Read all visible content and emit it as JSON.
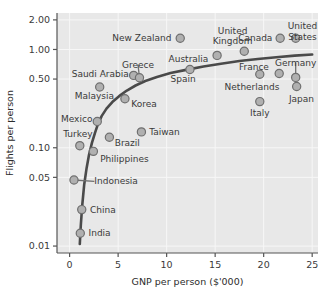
{
  "chart_data": {
    "type": "scatter",
    "title": "",
    "xlabel": "GNP per person ($'000)",
    "ylabel": "Flights per person",
    "xlim": [
      -1.3,
      25.6
    ],
    "ylim": [
      0.0085,
      2.35
    ],
    "yscale": "log",
    "xscale": "linear",
    "xticks": [
      "0",
      "5",
      "10",
      "15",
      "20",
      "25"
    ],
    "xtick_values": [
      0,
      5,
      10,
      15,
      20,
      25
    ],
    "yticks": [
      "2.00",
      "1.00",
      "0.50",
      "0.10",
      "0.05",
      "0.01"
    ],
    "ytick_values": [
      2.0,
      1.0,
      0.5,
      0.1,
      0.05,
      0.01
    ],
    "grid": true,
    "legend": "none",
    "plot_bgcolor": "#e8e8e8",
    "marker_fill": "#b0b0b0",
    "marker_edge": "#6f6f6f",
    "curve_color": "#4a4a4a",
    "gridline_color": "#f7f7f7",
    "axis_color": "#555555",
    "points": [
      {
        "name": "India",
        "x": 1.1,
        "y": 0.0135,
        "lx": 1.95,
        "ly": 0.0135,
        "anchor": "start",
        "leader": false
      },
      {
        "name": "China",
        "x": 1.25,
        "y": 0.0235,
        "lx": 2.1,
        "ly": 0.0235,
        "anchor": "start",
        "leader": false
      },
      {
        "name": "Indonesia",
        "x": 0.45,
        "y": 0.047,
        "lx": 2.55,
        "ly": 0.0455,
        "anchor": "start",
        "leader": true
      },
      {
        "name": "Philippines",
        "x": 2.45,
        "y": 0.092,
        "lx": 3.15,
        "ly": 0.077,
        "anchor": "start",
        "leader": false
      },
      {
        "name": "Turkey",
        "x": 1.05,
        "y": 0.105,
        "lx": 0.85,
        "ly": 0.138,
        "anchor": "middle",
        "leader": false
      },
      {
        "name": "Brazil",
        "x": 4.1,
        "y": 0.128,
        "lx": 4.65,
        "ly": 0.112,
        "anchor": "start",
        "leader": false
      },
      {
        "name": "Taiwan",
        "x": 7.4,
        "y": 0.145,
        "lx": 8.2,
        "ly": 0.146,
        "anchor": "start",
        "leader": false
      },
      {
        "name": "Mexico",
        "x": 2.85,
        "y": 0.185,
        "lx": 2.35,
        "ly": 0.197,
        "anchor": "end",
        "leader": false
      },
      {
        "name": "Korea",
        "x": 5.7,
        "y": 0.315,
        "lx": 6.35,
        "ly": 0.282,
        "anchor": "start",
        "leader": false
      },
      {
        "name": "Malaysia",
        "x": 3.1,
        "y": 0.415,
        "lx": 2.55,
        "ly": 0.335,
        "anchor": "middle",
        "leader": false
      },
      {
        "name": "Saudi Arabia",
        "x": 6.6,
        "y": 0.545,
        "lx": 6.1,
        "ly": 0.56,
        "anchor": "end",
        "leader": false
      },
      {
        "name": "Greece",
        "x": 7.2,
        "y": 0.515,
        "lx": 7.05,
        "ly": 0.7,
        "anchor": "middle",
        "leader": true
      },
      {
        "name": "Spain",
        "x": 12.4,
        "y": 0.625,
        "lx": 11.7,
        "ly": 0.5,
        "anchor": "middle",
        "leader": false
      },
      {
        "name": "Australia",
        "x": 15.2,
        "y": 0.87,
        "lx": 14.3,
        "ly": 0.8,
        "anchor": "end",
        "leader": false
      },
      {
        "name": "New Zealand",
        "x": 11.4,
        "y": 1.3,
        "lx": 10.5,
        "ly": 1.3,
        "anchor": "end",
        "leader": false
      },
      {
        "name": "United Kingdom",
        "x": 18.0,
        "y": 0.96,
        "lx": 16.8,
        "ly": 1.55,
        "anchor": "middle",
        "leader": false
      },
      {
        "name": "Canada",
        "x": 21.7,
        "y": 1.3,
        "lx": 20.9,
        "ly": 1.32,
        "anchor": "end",
        "leader": false
      },
      {
        "name": "United States",
        "x": 23.3,
        "y": 1.3,
        "lx": 24.0,
        "ly": 1.72,
        "anchor": "middle",
        "leader": false
      },
      {
        "name": "France",
        "x": 19.6,
        "y": 0.56,
        "lx": 19.0,
        "ly": 0.66,
        "anchor": "middle",
        "leader": false
      },
      {
        "name": "Germany",
        "x": 23.3,
        "y": 0.52,
        "lx": 23.3,
        "ly": 0.73,
        "anchor": "middle",
        "leader": true
      },
      {
        "name": "Netherlands",
        "x": 21.6,
        "y": 0.57,
        "lx": 18.8,
        "ly": 0.42,
        "anchor": "middle",
        "leader": false
      },
      {
        "name": "Italy",
        "x": 19.6,
        "y": 0.295,
        "lx": 19.6,
        "ly": 0.225,
        "anchor": "middle",
        "leader": false
      },
      {
        "name": "Japan",
        "x": 23.4,
        "y": 0.42,
        "lx": 23.9,
        "ly": 0.31,
        "anchor": "middle",
        "leader": false
      }
    ],
    "curve": [
      [
        1.05,
        0.0105
      ],
      [
        1.15,
        0.016
      ],
      [
        1.3,
        0.026
      ],
      [
        1.5,
        0.042
      ],
      [
        1.75,
        0.062
      ],
      [
        2.0,
        0.085
      ],
      [
        2.3,
        0.112
      ],
      [
        2.6,
        0.14
      ],
      [
        2.9,
        0.172
      ],
      [
        3.3,
        0.21
      ],
      [
        3.8,
        0.25
      ],
      [
        4.4,
        0.292
      ],
      [
        5.1,
        0.335
      ],
      [
        5.9,
        0.382
      ],
      [
        6.8,
        0.43
      ],
      [
        7.8,
        0.478
      ],
      [
        9.0,
        0.525
      ],
      [
        10.4,
        0.575
      ],
      [
        12.0,
        0.62
      ],
      [
        13.8,
        0.672
      ],
      [
        15.6,
        0.715
      ],
      [
        17.5,
        0.762
      ],
      [
        19.4,
        0.8
      ],
      [
        21.3,
        0.835
      ],
      [
        23.2,
        0.865
      ],
      [
        25.0,
        0.888
      ]
    ]
  }
}
